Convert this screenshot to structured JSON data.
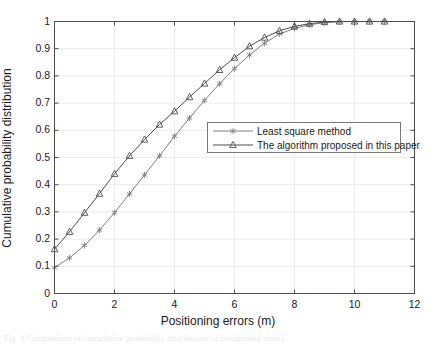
{
  "chart_data": {
    "type": "line",
    "title": "",
    "xlabel": "Positioning errors (m)",
    "ylabel": "Cumulative probability distribution",
    "xlim": [
      0,
      12
    ],
    "ylim": [
      0,
      1
    ],
    "xticks": [
      0,
      2,
      4,
      6,
      8,
      10,
      12
    ],
    "xtick_labels": [
      "0",
      "2",
      "4",
      "6",
      "8",
      "10",
      "12"
    ],
    "yticks": [
      0,
      0.1,
      0.2,
      0.3,
      0.4,
      0.5,
      0.6,
      0.7,
      0.8,
      0.9,
      1
    ],
    "ytick_labels": [
      "0",
      "0.1",
      "0.2",
      "0.3",
      "0.4",
      "0.5",
      "0.6",
      "0.7",
      "0.8",
      "0.9",
      "1"
    ],
    "grid": true,
    "legend_position": "center-right",
    "x": [
      0,
      0.5,
      1,
      1.5,
      2,
      2.5,
      3,
      3.5,
      4,
      4.5,
      5,
      5.5,
      6,
      6.5,
      7,
      7.5,
      8,
      8.5,
      9,
      9.5,
      10,
      10.5,
      11
    ],
    "series": [
      {
        "name": "Least square method",
        "marker": "star",
        "color": "#808080",
        "values": [
          0.095,
          0.131,
          0.177,
          0.233,
          0.297,
          0.366,
          0.436,
          0.506,
          0.578,
          0.645,
          0.71,
          0.771,
          0.827,
          0.877,
          0.92,
          0.954,
          0.975,
          0.988,
          0.996,
          0.999,
          1.0,
          1.0,
          1.0
        ]
      },
      {
        "name": "The algorithm proposed in this paper",
        "marker": "triangle",
        "color": "#4d4d4d",
        "values": [
          0.163,
          0.227,
          0.297,
          0.367,
          0.44,
          0.506,
          0.566,
          0.621,
          0.67,
          0.722,
          0.772,
          0.822,
          0.867,
          0.909,
          0.941,
          0.966,
          0.982,
          0.992,
          0.998,
          1.0,
          1.0,
          1.0,
          1.0
        ]
      }
    ]
  },
  "legend": {
    "entries": [
      {
        "label": "Least square method",
        "marker": "star-marker"
      },
      {
        "label": "The algorithm proposed in this paper",
        "marker": "triangle-marker"
      }
    ]
  },
  "caption": {
    "text": "Fig. 8  Comparison of cumulative probability distribution of positioning errors"
  },
  "colors": {
    "axis": "#4d4d4d",
    "grid": "#ebebeb",
    "series_least_square": "#808080",
    "series_proposed": "#4d4d4d",
    "text": "#1a1a1a",
    "background": "#ffffff"
  }
}
